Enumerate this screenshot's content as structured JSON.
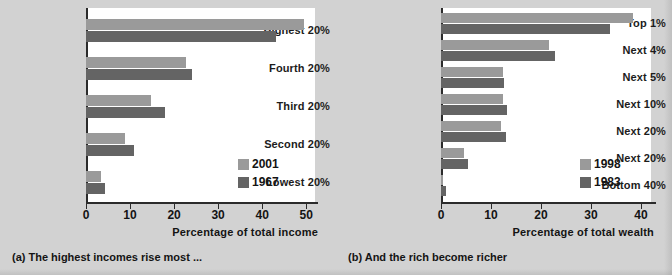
{
  "figure": {
    "panel_a_caption": "(a) The highest incomes rise most ...",
    "panel_b_caption": "(b) And the rich become richer"
  },
  "colors": {
    "panel_background": "#d2d2d2",
    "plot_background": "#ffffff",
    "series_light": "#9a9a9a",
    "series_dark": "#646464",
    "axis": "#2b2b2b",
    "text": "#141414"
  },
  "chart_data": [
    {
      "type": "bar",
      "orientation": "horizontal",
      "title": "(a) The highest incomes rise most ...",
      "xlabel": "Percentage of total income",
      "ylabel": "",
      "xlim": [
        0,
        52
      ],
      "xticks": [
        0,
        10,
        20,
        30,
        40,
        50
      ],
      "xticklabels": [
        "0",
        "10",
        "20",
        "30",
        "40",
        "50"
      ],
      "grid": false,
      "legend_position": "inside-lower-right",
      "categories": [
        "Highest 20%",
        "Fourth 20%",
        "Third 20%",
        "Second 20%",
        "Lowest 20%"
      ],
      "series": [
        {
          "name": "2001",
          "color": "#9a9a9a",
          "values": [
            49.6,
            22.7,
            14.8,
            8.9,
            3.4
          ]
        },
        {
          "name": "1967",
          "color": "#646464",
          "values": [
            43.2,
            24.1,
            17.9,
            11.0,
            4.3
          ]
        }
      ]
    },
    {
      "type": "bar",
      "orientation": "horizontal",
      "title": "(b) And the rich become richer",
      "xlabel": "Percentage of total wealth",
      "ylabel": "",
      "xlim": [
        0,
        42
      ],
      "xticks": [
        0,
        10,
        20,
        30,
        40
      ],
      "xticklabels": [
        "0",
        "10",
        "20",
        "30",
        "40"
      ],
      "grid": false,
      "legend_position": "inside-lower-right",
      "categories": [
        "Top 1%",
        "Next 4%",
        "Next 5%",
        "Next 10%",
        "Next 20%",
        "Next 20%",
        "Bottom 40%"
      ],
      "series": [
        {
          "name": "1998",
          "color": "#9a9a9a",
          "values": [
            38.3,
            21.6,
            12.4,
            12.4,
            12.0,
            4.5,
            0.3
          ]
        },
        {
          "name": "1983",
          "color": "#646464",
          "values": [
            33.8,
            22.8,
            12.5,
            13.2,
            13.0,
            5.4,
            0.9
          ]
        }
      ]
    }
  ]
}
